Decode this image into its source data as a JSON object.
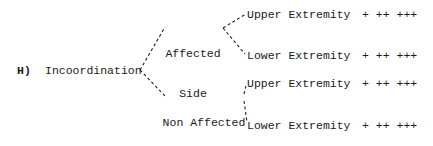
{
  "item": {
    "label": "H)",
    "title": "Incoordination",
    "branches": [
      {
        "line1": "Affected",
        "line2": "Side",
        "children": [
          {
            "label": "Upper Extremity",
            "scale": "+ ++ +++"
          },
          {
            "label": "Lower Extremity",
            "scale": "+ ++ +++"
          }
        ]
      },
      {
        "line1": "Non Affected",
        "line2": "Side",
        "children": [
          {
            "label": "Upper Extremity",
            "scale": "+ ++ +++"
          },
          {
            "label": "Lower Extremity",
            "scale": "+ ++ +++"
          }
        ]
      }
    ]
  }
}
